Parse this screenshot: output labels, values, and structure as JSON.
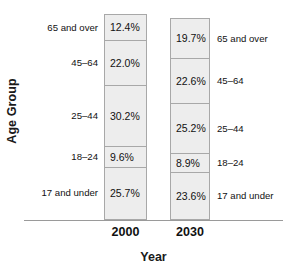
{
  "chart_data": {
    "type": "bar",
    "subtype": "stacked-percent",
    "title": "",
    "xlabel": "Year",
    "ylabel": "Age Group",
    "categories": [
      "2000",
      "2030"
    ],
    "grid": false,
    "legend": "none",
    "axis_note": "Each bar totals 100%; segments ordered bottom-to-top",
    "stack_order_bottom_to_top": [
      "17 and under",
      "18–24",
      "25–44",
      "45–64",
      "65 and over"
    ],
    "series": [
      {
        "name": "17 and under",
        "values": [
          25.7,
          23.6
        ],
        "labels": [
          "25.7%",
          "23.6%"
        ]
      },
      {
        "name": "18–24",
        "values": [
          9.6,
          8.9
        ],
        "labels": [
          "9.6%",
          "8.9%"
        ]
      },
      {
        "name": "25–44",
        "values": [
          30.2,
          25.2
        ],
        "labels": [
          "30.2%",
          "25.2%"
        ]
      },
      {
        "name": "45–64",
        "values": [
          22.0,
          22.6
        ],
        "labels": [
          "22.0%",
          "22.6%"
        ]
      },
      {
        "name": "65 and over",
        "values": [
          12.4,
          19.7
        ],
        "labels": [
          "12.4%",
          "19.7%"
        ]
      }
    ],
    "bars": [
      {
        "category": "2000",
        "total": 99.9,
        "segments_top_to_bottom": [
          {
            "group": "65 and over",
            "value": 12.4,
            "label": "12.4%"
          },
          {
            "group": "45–64",
            "value": 22.0,
            "label": "22.0%"
          },
          {
            "group": "25–44",
            "value": 30.2,
            "label": "30.2%"
          },
          {
            "group": "18–24",
            "value": 9.6,
            "label": "9.6%"
          },
          {
            "group": "17 and under",
            "value": 25.7,
            "label": "25.7%"
          }
        ]
      },
      {
        "category": "2030",
        "total": 100.0,
        "segments_top_to_bottom": [
          {
            "group": "65 and over",
            "value": 19.7,
            "label": "19.7%"
          },
          {
            "group": "45–64",
            "value": 22.6,
            "label": "22.6%"
          },
          {
            "group": "25–44",
            "value": 25.2,
            "label": "25.2%"
          },
          {
            "group": "18–24",
            "value": 8.9,
            "label": "8.9%"
          },
          {
            "group": "17 and under",
            "value": 23.6,
            "label": "23.6%"
          }
        ]
      }
    ],
    "colors": {
      "segment_fill": "#ededed",
      "segment_border": "#a8a8a8",
      "axis_line": "#9a9a9a",
      "text": "#111111",
      "title_text": "#1a1a1a",
      "background": "#ffffff"
    }
  }
}
